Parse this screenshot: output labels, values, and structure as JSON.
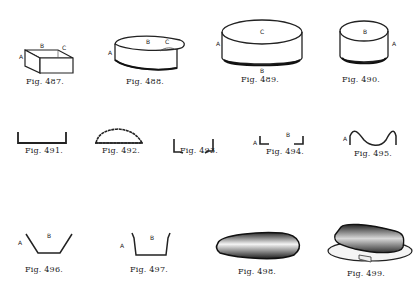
{
  "plate": {
    "figures": [
      {
        "id": "487",
        "caption": "Fig. 487.",
        "subject": "rectangular box blank",
        "labels": {
          "a": "A",
          "b": "B",
          "c": "C"
        }
      },
      {
        "id": "488",
        "caption": "Fig. 488.",
        "subject": "pear-shaped band",
        "labels": {
          "a": "A",
          "b": "B",
          "c": "C"
        }
      },
      {
        "id": "489",
        "caption": "Fig. 489.",
        "subject": "oval band",
        "labels": {
          "a": "A",
          "b": "B",
          "c": "C"
        }
      },
      {
        "id": "490",
        "caption": "Fig. 490.",
        "subject": "round band",
        "labels": {
          "a": "A",
          "b": "B"
        }
      },
      {
        "id": "491",
        "caption": "Fig. 491.",
        "subject": "channel section"
      },
      {
        "id": "492",
        "caption": "Fig. 492.",
        "subject": "crimped dome section"
      },
      {
        "id": "493",
        "caption": "Fig. 493.",
        "subject": "split edge section"
      },
      {
        "id": "494",
        "caption": "Fig. 494.",
        "subject": "square channel section",
        "labels": {
          "a": "A",
          "b": "B"
        }
      },
      {
        "id": "495",
        "caption": "Fig. 495.",
        "subject": "curved section",
        "labels": {
          "a": "A"
        }
      },
      {
        "id": "496",
        "caption": "Fig. 496.",
        "subject": "sloped tray section",
        "labels": {
          "a": "A",
          "b": "B"
        }
      },
      {
        "id": "497",
        "caption": "Fig. 497.",
        "subject": "deep tray section",
        "labels": {
          "a": "A",
          "b": "B"
        }
      },
      {
        "id": "498",
        "caption": "Fig. 498.",
        "subject": "tapered pan"
      },
      {
        "id": "499",
        "caption": "Fig. 499.",
        "subject": "covered butter dish"
      }
    ]
  }
}
